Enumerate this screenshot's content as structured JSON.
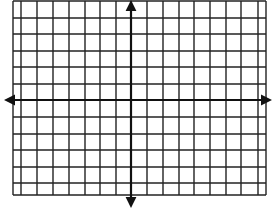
{
  "diagram": {
    "type": "coordinate-plane",
    "colors": {
      "background": "#ffffff",
      "grid": "#222222",
      "axis": "#111111"
    },
    "grid": {
      "left": 13,
      "right": 266,
      "top": 1,
      "bottom": 195,
      "vertical_lines": [
        13,
        21,
        37,
        53,
        69,
        85,
        100,
        116,
        131,
        147,
        163,
        179,
        194,
        210,
        226,
        241,
        258,
        266
      ],
      "horizontal_lines": [
        1,
        18,
        34,
        51,
        67,
        84,
        100,
        117,
        134,
        150,
        167,
        183,
        195
      ],
      "line_width": 1.4
    },
    "axes": {
      "x_axis": {
        "y": 100,
        "from": 4,
        "to": 272,
        "arrow_left": true,
        "arrow_right": true
      },
      "y_axis": {
        "x": 131,
        "from": 0,
        "to": 208,
        "arrow_top": true,
        "arrow_bottom": true
      },
      "line_width": 2.2,
      "arrow_size": 9
    },
    "labels": []
  }
}
